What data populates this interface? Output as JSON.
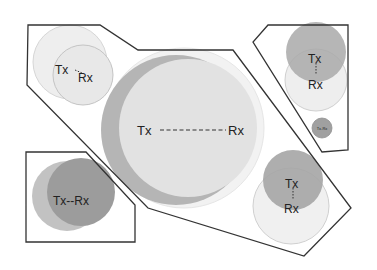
{
  "diagram": {
    "colors": {
      "outline": "#333333",
      "dark_circle": "#9a9a9a",
      "mid_circle": "#bcbcbc",
      "light_circle": "#e4e4e4",
      "faint_circle": "#f0f0f0",
      "background": "#ffffff"
    },
    "groups": [
      {
        "id": "top-left-large",
        "polygon": "28,25 100,25 138,50 233,50 351,208 304,256 148,208 27,85",
        "pairs": [
          {
            "tx_label": "Tx",
            "rx_label": "Rx",
            "tx": [
              63,
              70
            ],
            "rx": [
              88,
              80
            ]
          },
          {
            "tx_label": "Tx",
            "rx_label": "Rx",
            "tx": [
              147,
              130
            ],
            "rx": [
              238,
              130
            ]
          },
          {
            "tx_label": "Tx",
            "rx_label": "Rx",
            "tx": [
              293,
              184
            ],
            "rx": [
              292,
              210
            ]
          }
        ]
      },
      {
        "id": "top-right",
        "polygon": "268,25 348,25 348,150 322,152 253,42",
        "pairs": [
          {
            "tx_label": "Tx",
            "rx_label": "Rx",
            "tx": [
              316,
              58
            ],
            "rx": [
              316,
              85
            ]
          },
          {
            "label": "Tx-Rx",
            "center": [
              322,
              128
            ]
          }
        ]
      },
      {
        "id": "bottom-left",
        "polygon": "26,152 86,152 135,205 135,242 26,242",
        "pairs": [
          {
            "label": "Tx--Rx",
            "center": [
              75,
              200
            ]
          }
        ]
      }
    ],
    "labels": {
      "tl_tx": "Tx",
      "tl_rx": "Rx",
      "center_tx": "Tx",
      "center_rx": "Rx",
      "tr_tx": "Tx",
      "tr_rx": "Rx",
      "tr_small": "Tx-Rx",
      "bl_pair": "Tx--Rx",
      "br_tx": "Tx",
      "br_rx": "Rx"
    }
  }
}
